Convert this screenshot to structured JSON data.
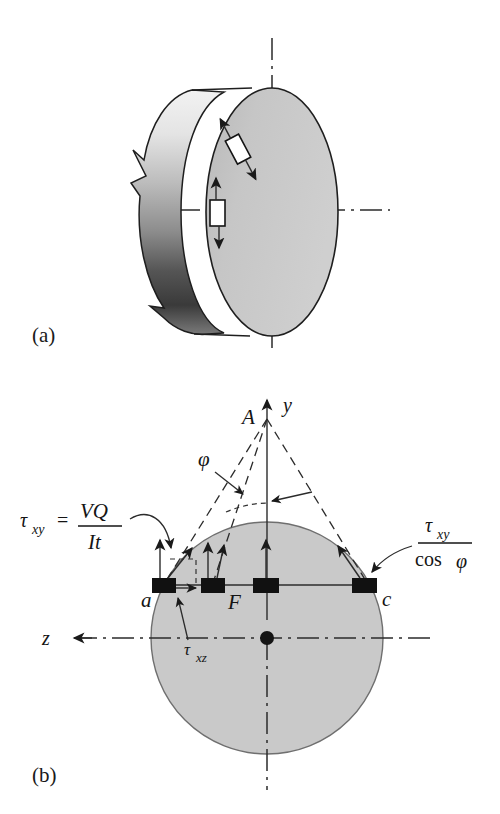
{
  "figure": {
    "title_absent": true,
    "panels": [
      {
        "id": "a",
        "label": "(a)",
        "caption_absent": true
      },
      {
        "id": "b",
        "label": "(b)",
        "caption_absent": true
      }
    ]
  },
  "panel_a": {
    "label": "(a)",
    "description": "circular cross-section shaft shown in pictorial view with two shear stress elements on the front face",
    "elements": [
      {
        "name": "shear-element-upper",
        "orientation": "inclined"
      },
      {
        "name": "shear-element-lower",
        "orientation": "vertical"
      }
    ],
    "axes": [
      {
        "name": "vertical-centerline"
      },
      {
        "name": "horizontal-centerline"
      }
    ]
  },
  "panel_b": {
    "label": "(b)",
    "point_A": "A",
    "axis_y": "y",
    "axis_z": "z",
    "angle_phi": "φ",
    "point_a": "a",
    "point_F": "F",
    "point_c": "c",
    "tau_xz": {
      "symbol": "τ",
      "subscript": "xz"
    },
    "formula_left": {
      "lhs_symbol": "τ",
      "lhs_subscript": "xy",
      "equals": "=",
      "numerator": "VQ",
      "denominator": "It"
    },
    "formula_right": {
      "numerator_symbol": "τ",
      "numerator_subscript": "xy",
      "denominator_fn": "cos",
      "denominator_arg": "φ"
    },
    "stress_elements": [
      {
        "name": "element-a",
        "x": 163,
        "arrows": [
          "vertical",
          "inclined",
          "horizontal"
        ]
      },
      {
        "name": "element-2",
        "x": 212,
        "arrows": [
          "vertical",
          "inclined"
        ]
      },
      {
        "name": "element-3",
        "x": 262,
        "arrows": [
          "vertical"
        ]
      },
      {
        "name": "element-c",
        "x": 363,
        "arrows": [
          "inclined"
        ]
      }
    ],
    "circle": {
      "cx": 267,
      "cy": 638,
      "r": 116
    },
    "chord_y": 585
  },
  "colors": {
    "ink": "#141414",
    "circle_fill": "#c9c9c9",
    "circle_stroke": "#6f6f6f",
    "cylinder_face": "#c4c4c4",
    "page_bg": "#ffffff"
  }
}
